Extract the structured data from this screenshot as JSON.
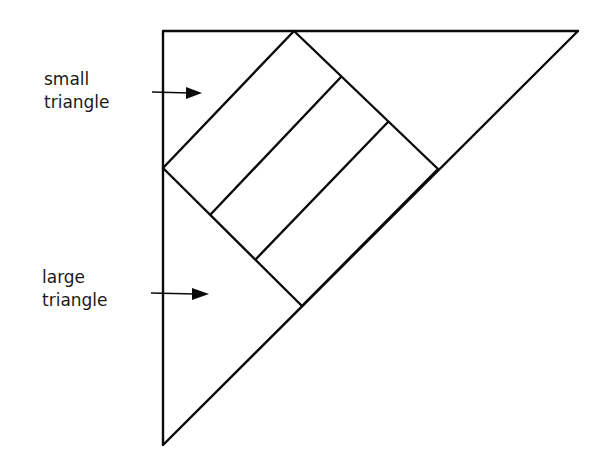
{
  "diagram": {
    "type": "geometric-figure",
    "labels": [
      {
        "id": "small",
        "line1": "small",
        "line2": "triangle"
      },
      {
        "id": "large",
        "line1": "large",
        "line2": "triangle"
      }
    ],
    "stroke_color": "#0a0a0a",
    "shapes": {
      "outer_triangle": [
        [
          163,
          31
        ],
        [
          578,
          31
        ],
        [
          163,
          445
        ]
      ],
      "rectangle": [
        [
          163,
          168
        ],
        [
          294,
          31
        ],
        [
          438,
          169
        ],
        [
          302,
          306
        ]
      ],
      "inner_divider_1": [
        [
          211,
          214
        ],
        [
          341,
          77
        ]
      ],
      "inner_divider_2": [
        [
          256,
          259
        ],
        [
          388,
          122
        ]
      ]
    },
    "arrows": [
      {
        "target": "small triangle",
        "from": [
          152,
          92
        ],
        "to": [
          202,
          93
        ]
      },
      {
        "target": "large triangle",
        "from": [
          151,
          293
        ],
        "to": [
          209,
          294
        ]
      }
    ]
  }
}
